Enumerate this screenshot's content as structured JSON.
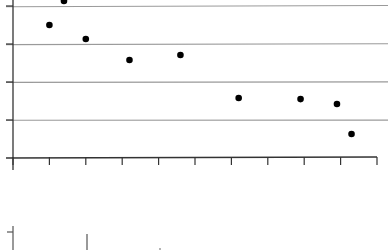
{
  "chart_data": [
    {
      "type": "scatter",
      "title": "",
      "xlabel": "",
      "ylabel": "",
      "grid": true,
      "legend": null,
      "x_ticks_count": 11,
      "y_gridlines": [
        1,
        2,
        3,
        4
      ],
      "xlim": [
        0,
        10
      ],
      "ylim": [
        0,
        4.2
      ],
      "points": [
        {
          "x": 1.4,
          "y": 4.13
        },
        {
          "x": 1.0,
          "y": 3.5
        },
        {
          "x": 2.0,
          "y": 3.13
        },
        {
          "x": 3.2,
          "y": 2.58
        },
        {
          "x": 4.6,
          "y": 2.71
        },
        {
          "x": 6.2,
          "y": 1.58
        },
        {
          "x": 7.9,
          "y": 1.55
        },
        {
          "x": 8.9,
          "y": 1.42
        },
        {
          "x": 9.3,
          "y": 0.63
        }
      ],
      "colors": {
        "points": "#000000",
        "grid": "#9a9a9a",
        "axis": "#333333"
      }
    },
    {
      "type": "partial",
      "note_visible": "top edge of a second chart: y-axis with one tick and a vertical mark",
      "colors": {
        "axis": "#555555"
      }
    }
  ]
}
